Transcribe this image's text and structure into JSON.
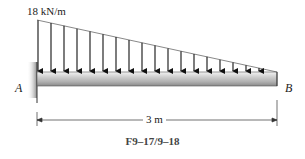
{
  "figure": {
    "load_label": "18 kN/m",
    "support_a_label": "A",
    "support_b_label": "B",
    "span_label": "3 m",
    "caption": "F9–17/9–18"
  },
  "load": {
    "type": "triangular distributed load",
    "max_intensity": "18 kN/m",
    "max_at": "A",
    "zero_at": "B",
    "arrow_count": 19
  },
  "beam": {
    "length": "3 m",
    "support": "fixed wall at A",
    "free_end": "B"
  },
  "colors": {
    "beam_top": "#e6e6e6",
    "beam_mid": "#b9b9b9",
    "beam_bottom": "#8c8c8c",
    "arrow": "#111111",
    "wall_shadow": "#9a9a9a"
  }
}
